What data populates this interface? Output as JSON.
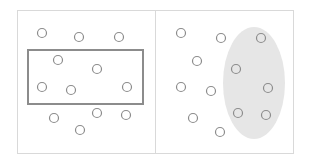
{
  "diagram": {
    "colors": {
      "panel_border": "#d9d9d9",
      "shape_stroke": "#8c8c8c",
      "ellipse_fill": "#e6e6e6",
      "point_stroke": "#8c8c8c"
    },
    "panels": [
      {
        "name": "rectangle-selection",
        "frame": {
          "x": 17,
          "y": 10,
          "w": 138,
          "h": 143
        },
        "shape": {
          "type": "rect",
          "x": 28,
          "y": 50,
          "w": 115,
          "h": 54
        },
        "points": [
          [
            42,
            33
          ],
          [
            79,
            37
          ],
          [
            119,
            37
          ],
          [
            58,
            60
          ],
          [
            97,
            69
          ],
          [
            42,
            87
          ],
          [
            71,
            90
          ],
          [
            127,
            87
          ],
          [
            54,
            118
          ],
          [
            97,
            113
          ],
          [
            126,
            115
          ],
          [
            80,
            130
          ]
        ]
      },
      {
        "name": "ellipse-selection",
        "frame": {
          "x": 155,
          "y": 10,
          "w": 138,
          "h": 143
        },
        "shape": {
          "type": "ellipse",
          "cx": 254,
          "cy": 83,
          "rx": 31,
          "ry": 56
        },
        "points": [
          [
            181,
            33
          ],
          [
            221,
            38
          ],
          [
            261,
            38
          ],
          [
            197,
            61
          ],
          [
            236,
            69
          ],
          [
            181,
            87
          ],
          [
            211,
            91
          ],
          [
            268,
            88
          ],
          [
            193,
            118
          ],
          [
            238,
            113
          ],
          [
            266,
            115
          ],
          [
            220,
            132
          ]
        ]
      }
    ]
  }
}
